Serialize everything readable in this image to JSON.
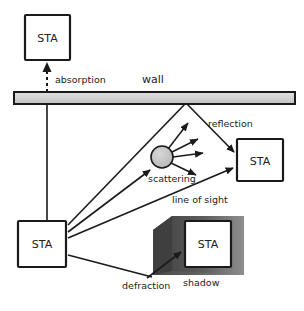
{
  "diagram": {
    "type": "schematic",
    "colors": {
      "stroke": "#1a1a1a",
      "wall_fill": "#d0d0d0",
      "scatterer_fill": "#c4c4c4",
      "shadow_dark": "#555555",
      "shadow_light": "#8a8a8a",
      "background": "#ffffff",
      "text": "#222222"
    },
    "nodes": [
      {
        "id": "sta-top",
        "label": "STA",
        "x": 25,
        "y": 15,
        "w": 45,
        "h": 45
      },
      {
        "id": "sta-right",
        "label": "STA",
        "x": 237,
        "y": 139,
        "w": 46,
        "h": 42
      },
      {
        "id": "sta-source",
        "label": "STA",
        "x": 18,
        "y": 221,
        "w": 48,
        "h": 46
      },
      {
        "id": "sta-shadow",
        "label": "STA",
        "x": 185,
        "y": 221,
        "w": 46,
        "h": 46
      }
    ],
    "wall": {
      "label": "wall",
      "x": 14,
      "y": 92,
      "w": 281,
      "h": 12
    },
    "scatterer": {
      "label": "scattering",
      "cx": 162,
      "cy": 157,
      "r": 11
    },
    "shadow": {
      "label": "shadow"
    },
    "labels": {
      "absorption": "absorption",
      "wall": "wall",
      "reflection": "reflection",
      "scattering": "scattering",
      "line_of_sight": "line of sight",
      "defraction": "defraction",
      "shadow": "shadow"
    },
    "paths": [
      {
        "id": "absorption",
        "from": "wall",
        "to": "sta-top",
        "style": "dashed",
        "label": "absorption"
      },
      {
        "id": "to-wall",
        "from": "sta-source",
        "to": "wall",
        "style": "solid",
        "label": ""
      },
      {
        "id": "reflection",
        "from": "wall",
        "to": "sta-right",
        "style": "solid-arrow",
        "label": "reflection"
      },
      {
        "id": "scattering-in",
        "from": "sta-source",
        "to": "scatterer",
        "style": "solid-arrow",
        "label": "scattering"
      },
      {
        "id": "line-of-sight",
        "from": "sta-source",
        "to": "sta-right",
        "style": "solid-arrow",
        "label": "line of sight"
      },
      {
        "id": "defraction",
        "from": "shadow-edge",
        "to": "sta-shadow",
        "style": "solid-arrow",
        "label": "defraction"
      }
    ]
  }
}
